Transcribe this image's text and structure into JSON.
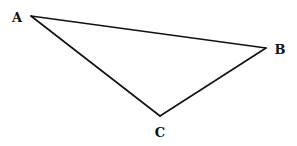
{
  "diagram": {
    "type": "triangle",
    "stroke_color": "#111111",
    "background": "#ffffff",
    "vertices": [
      {
        "label": "A",
        "x": 31,
        "y": 16,
        "label_x": 17,
        "label_y": 22
      },
      {
        "label": "B",
        "x": 266,
        "y": 48,
        "label_x": 280,
        "label_y": 54
      },
      {
        "label": "C",
        "x": 160,
        "y": 116,
        "label_x": 160,
        "label_y": 137
      }
    ],
    "edges": [
      {
        "from": "A",
        "to": "B"
      },
      {
        "from": "B",
        "to": "C"
      },
      {
        "from": "C",
        "to": "A"
      }
    ]
  }
}
